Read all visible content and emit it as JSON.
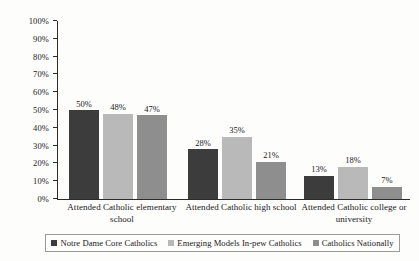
{
  "chart_data": {
    "type": "bar",
    "title": "",
    "subtitle": "",
    "xlabel": "",
    "ylabel": "",
    "ylim": [
      0,
      100
    ],
    "grid": false,
    "legend_position": "bottom",
    "categories": [
      "Attended Catholic elementary school",
      "Attended Catholic high school",
      "Attended Catholic college or university"
    ],
    "y_ticks": [
      "100%",
      "90%",
      "80%",
      "70%",
      "60%",
      "50%",
      "40%",
      "30%",
      "20%",
      "10%",
      "0%"
    ],
    "y_tick_values": [
      100,
      90,
      80,
      70,
      60,
      50,
      40,
      30,
      20,
      10,
      0
    ],
    "series": [
      {
        "name": "Notre Dame Core Catholics",
        "color": "#3c3c3c",
        "values": [
          50,
          28,
          13
        ],
        "labels": [
          "50%",
          "28%",
          "13%"
        ]
      },
      {
        "name": "Emerging Models In-pew Catholics",
        "color": "#b9b9b9",
        "values": [
          48,
          35,
          18
        ],
        "labels": [
          "48%",
          "35%",
          "18%"
        ]
      },
      {
        "name": "Catholics Nationally",
        "color": "#8e8e8e",
        "values": [
          47,
          21,
          7
        ],
        "labels": [
          "47%",
          "21%",
          "7%"
        ]
      }
    ]
  },
  "axis": {
    "line_color": "#2b2b2b"
  },
  "legend": {
    "border_color": "#9a9a9a"
  }
}
